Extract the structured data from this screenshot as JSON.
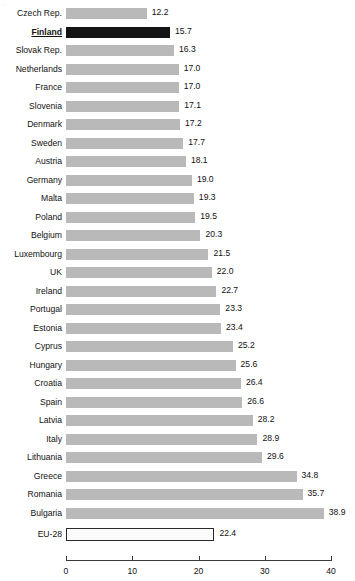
{
  "corner_fragment": "...",
  "chart_data": {
    "type": "bar",
    "orientation": "horizontal",
    "title": "",
    "subtitle": "",
    "xlabel": "",
    "ylabel": "",
    "xlim": [
      0,
      40
    ],
    "xticks": [
      0,
      10,
      20,
      30,
      40
    ],
    "xtick_labels": [
      "0",
      "10",
      "20",
      "30",
      "40"
    ],
    "grid": false,
    "legend": "none",
    "bar_color": "#b9b9b9",
    "highlight_color": "#141414",
    "total_color": "#ffffff",
    "total_border_color": "#2a2a2a",
    "highlight_category": "Finland",
    "total_category": "EU-28",
    "categories": [
      "Czech Rep.",
      "Finland",
      "Slovak Rep.",
      "Netherlands",
      "France",
      "Slovenia",
      "Denmark",
      "Sweden",
      "Austria",
      "Germany",
      "Malta",
      "Poland",
      "Belgium",
      "Luxembourg",
      "UK",
      "Ireland",
      "Portugal",
      "Estonia",
      "Cyprus",
      "Hungary",
      "Croatia",
      "Spain",
      "Latvia",
      "Italy",
      "Lithuania",
      "Greece",
      "Romania",
      "Bulgaria",
      "EU-28"
    ],
    "values": [
      12.2,
      15.7,
      16.3,
      17.0,
      17.0,
      17.1,
      17.2,
      17.7,
      18.1,
      19.0,
      19.3,
      19.5,
      20.3,
      21.5,
      22.0,
      22.7,
      23.3,
      23.4,
      25.2,
      25.6,
      26.4,
      26.6,
      28.2,
      28.9,
      29.6,
      34.8,
      35.7,
      38.9,
      22.4
    ],
    "value_labels": [
      "12.2",
      "15.7",
      "16.3",
      "17.0",
      "17.0",
      "17.1",
      "17.2",
      "17.7",
      "18.1",
      "19.0",
      "19.3",
      "19.5",
      "20.3",
      "21.5",
      "22.0",
      "22.7",
      "23.3",
      "23.4",
      "25.2",
      "25.6",
      "26.4",
      "26.6",
      "28.2",
      "28.9",
      "29.6",
      "34.8",
      "35.7",
      "38.9",
      "22.4"
    ]
  }
}
